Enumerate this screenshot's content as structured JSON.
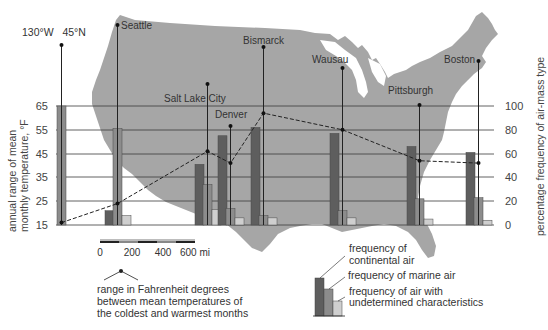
{
  "chart_data": {
    "type": "bar",
    "title": "",
    "categories": [
      "130°W 45°N",
      "Seattle",
      "Salt Lake City",
      "Denver",
      "Bismarck",
      "Wausau",
      "Pittsburgh",
      "Boston"
    ],
    "series": [
      {
        "name": "frequency of continental air",
        "axis": "right",
        "values": [
          0,
          12,
          51,
          75,
          82,
          77,
          66,
          61
        ]
      },
      {
        "name": "frequency of marine air",
        "axis": "right",
        "values": [
          100,
          81,
          34,
          14,
          8,
          12,
          22,
          23
        ]
      },
      {
        "name": "frequency of air with undetermined characteristics",
        "axis": "right",
        "values": [
          0,
          8,
          13,
          6,
          6,
          6,
          5,
          4
        ]
      },
      {
        "name": "range in Fahrenheit degrees between mean temperatures of the coldest and warmest months",
        "axis": "left",
        "type": "line",
        "style": "dashed",
        "values": [
          16,
          24,
          46,
          41,
          62,
          55,
          42,
          41
        ]
      }
    ],
    "left_axis": {
      "label": "annual range of mean monthly temperature, °F",
      "ticks": [
        15,
        25,
        35,
        45,
        55,
        65
      ],
      "ylim": [
        15,
        65
      ]
    },
    "right_axis": {
      "label": "percentage frequency of air-mass type",
      "ticks": [
        0,
        20,
        40,
        60,
        80,
        100
      ],
      "ylim": [
        0,
        100
      ]
    },
    "grid": true,
    "legend_position": "bottom-right"
  },
  "labels": {
    "coord": "130°W   45°N",
    "stations": [
      "Seattle",
      "Salt Lake City",
      "Denver",
      "Bismarck",
      "Wausau",
      "Pittsburgh",
      "Boston"
    ],
    "left_axis_line1": "annual range of mean",
    "left_axis_line2": "monthly temperature, °F",
    "right_axis": "percentage frequency of air-mass type",
    "left_ticks": [
      "65",
      "55",
      "45",
      "35",
      "25",
      "15"
    ],
    "right_ticks": [
      "100",
      "80",
      "60",
      "40",
      "20",
      "0"
    ]
  },
  "scale": {
    "ticks": [
      "0",
      "200",
      "400",
      "600 mi"
    ]
  },
  "legend": {
    "range_line1": "range in Fahrenheit degrees",
    "range_line2": "between mean temperatures of",
    "range_line3": "the coldest and warmest months",
    "continental_line1": "frequency of",
    "continental_line2": "continental air",
    "marine": "frequency of marine air",
    "undetermined_line1": "frequency of air with",
    "undetermined_line2": "undetermined characteristics"
  },
  "colors": {
    "map": "#a6a6a6",
    "continental": "#5e5e5e",
    "marine": "#8c8c8c",
    "undetermined": "#cfcfcf",
    "grid": "#3a3a3a",
    "text": "#333333"
  }
}
